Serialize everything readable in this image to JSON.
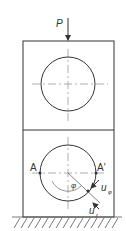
{
  "diagram": {
    "type": "mechanics-schematic",
    "load_label": "P",
    "point_left_label": "A",
    "point_right_label": "A'",
    "angle_label": "φ",
    "displacement_tangential_label": "u",
    "displacement_tangential_subscript": "φ",
    "displacement_radial_label": "u",
    "displacement_radial_subscript": "r",
    "colors": {
      "line": "#333333",
      "centerline": "#999999"
    }
  }
}
